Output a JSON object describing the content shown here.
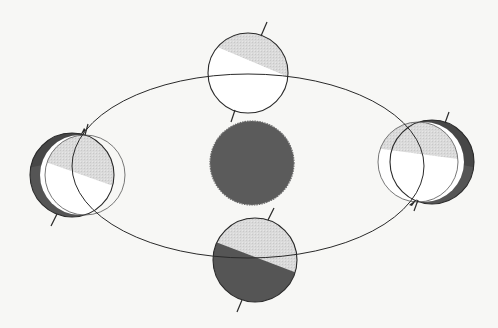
{
  "diagram": {
    "type": "earth-orbit-seasons",
    "colors": {
      "background": "#f7f7f5",
      "sun": "#5b5b5b",
      "night_dark": "#555555",
      "night_darker": "#464646",
      "day_light": "#d9d9d9",
      "day_white": "#ffffff",
      "outline": "#2a2a2a"
    },
    "sun": {
      "cx": 252,
      "cy": 163,
      "r": 42
    },
    "orbit": {
      "cx": 248,
      "cy": 166,
      "rx": 176,
      "ry": 92
    },
    "earths": [
      {
        "id": "top",
        "cx": 248,
        "cy": 73,
        "r": 40,
        "phase": "fully-lit"
      },
      {
        "id": "left",
        "cx": 72,
        "cy": 175,
        "r": 42,
        "phase": "lit-right"
      },
      {
        "id": "right",
        "cx": 432,
        "cy": 162,
        "r": 42,
        "phase": "lit-left"
      },
      {
        "id": "bottom",
        "cx": 255,
        "cy": 260,
        "r": 42,
        "phase": "half-lit"
      }
    ]
  }
}
